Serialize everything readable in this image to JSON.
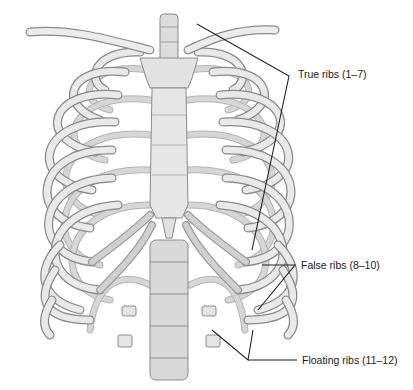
{
  "figure": {
    "colors": {
      "background": "#ffffff",
      "bone_fill": "#e9e9e9",
      "bone_outline": "#8a8a8a",
      "leader_line": "#222222",
      "label_text": "#1a1a1a"
    }
  },
  "labels": [
    {
      "id": "true-ribs",
      "text": "True ribs (1–7)"
    },
    {
      "id": "false-ribs",
      "text": "False ribs (8–10)"
    },
    {
      "id": "floating-ribs",
      "text": "Floating ribs (11–12)"
    }
  ]
}
